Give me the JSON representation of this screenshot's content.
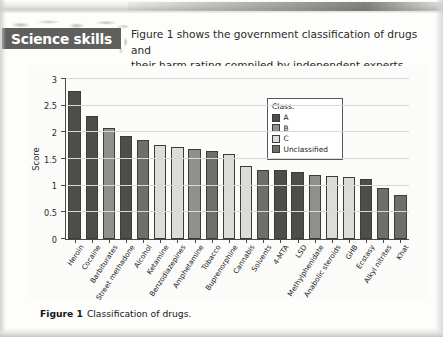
{
  "header": {
    "badge_label": "Science skills",
    "intro_line_1": "Figure 1 shows the government classification of drugs and",
    "intro_line_2": "their harm rating compiled by independent experts."
  },
  "caption": {
    "figure_label": "Figure 1",
    "text": "Classification of drugs."
  },
  "legend": {
    "title": "Class:",
    "items": [
      {
        "label": "A",
        "color": "#4d4d4b"
      },
      {
        "label": "B",
        "color": "#8f8f8d"
      },
      {
        "label": "C",
        "color": "#dcdcda"
      },
      {
        "label": "Unclassified",
        "color": "#6e6e6c"
      }
    ]
  },
  "colors": {
    "class_a": "#4d4d4b",
    "class_b": "#8f8f8d",
    "class_c": "#dcdcda",
    "unclassified": "#6e6e6c",
    "axis": "#4a4a48",
    "grid": "#d8d8d4",
    "badge_bg": "#5f605e"
  },
  "chart_data": {
    "type": "bar",
    "title": "",
    "xlabel": "",
    "ylabel": "Score",
    "ylim": [
      0,
      3
    ],
    "yticks": [
      0,
      0.5,
      1,
      1.5,
      2,
      2.5,
      3
    ],
    "ytick_labels": [
      "0",
      "0.5",
      "1",
      "1.5",
      "2",
      "2.5",
      "3"
    ],
    "grid": true,
    "legend_position": "upper-right-inside",
    "categories": [
      "Heroin",
      "Cocaine",
      "Barbiturates",
      "Street methadone",
      "Alcohol",
      "Ketamine",
      "Benzodiazepines",
      "Amphetamine",
      "Tobacco",
      "Buprenorphine",
      "Cannabis",
      "Solvents",
      "4-MTA",
      "LSD",
      "Methylphenidate",
      "Anabolic steroids",
      "GHB",
      "Ecstasy",
      "Alkyl nitrites",
      "Khat"
    ],
    "values": [
      2.78,
      2.31,
      2.08,
      1.94,
      1.86,
      1.76,
      1.72,
      1.69,
      1.65,
      1.6,
      1.37,
      1.29,
      1.29,
      1.25,
      1.2,
      1.18,
      1.16,
      1.13,
      0.96,
      0.83
    ],
    "classes": [
      "A",
      "A",
      "B",
      "A",
      "Unclassified",
      "C",
      "C",
      "B",
      "Unclassified",
      "C",
      "C",
      "Unclassified",
      "A",
      "A",
      "B",
      "C",
      "C",
      "A",
      "Unclassified",
      "Unclassified"
    ]
  }
}
